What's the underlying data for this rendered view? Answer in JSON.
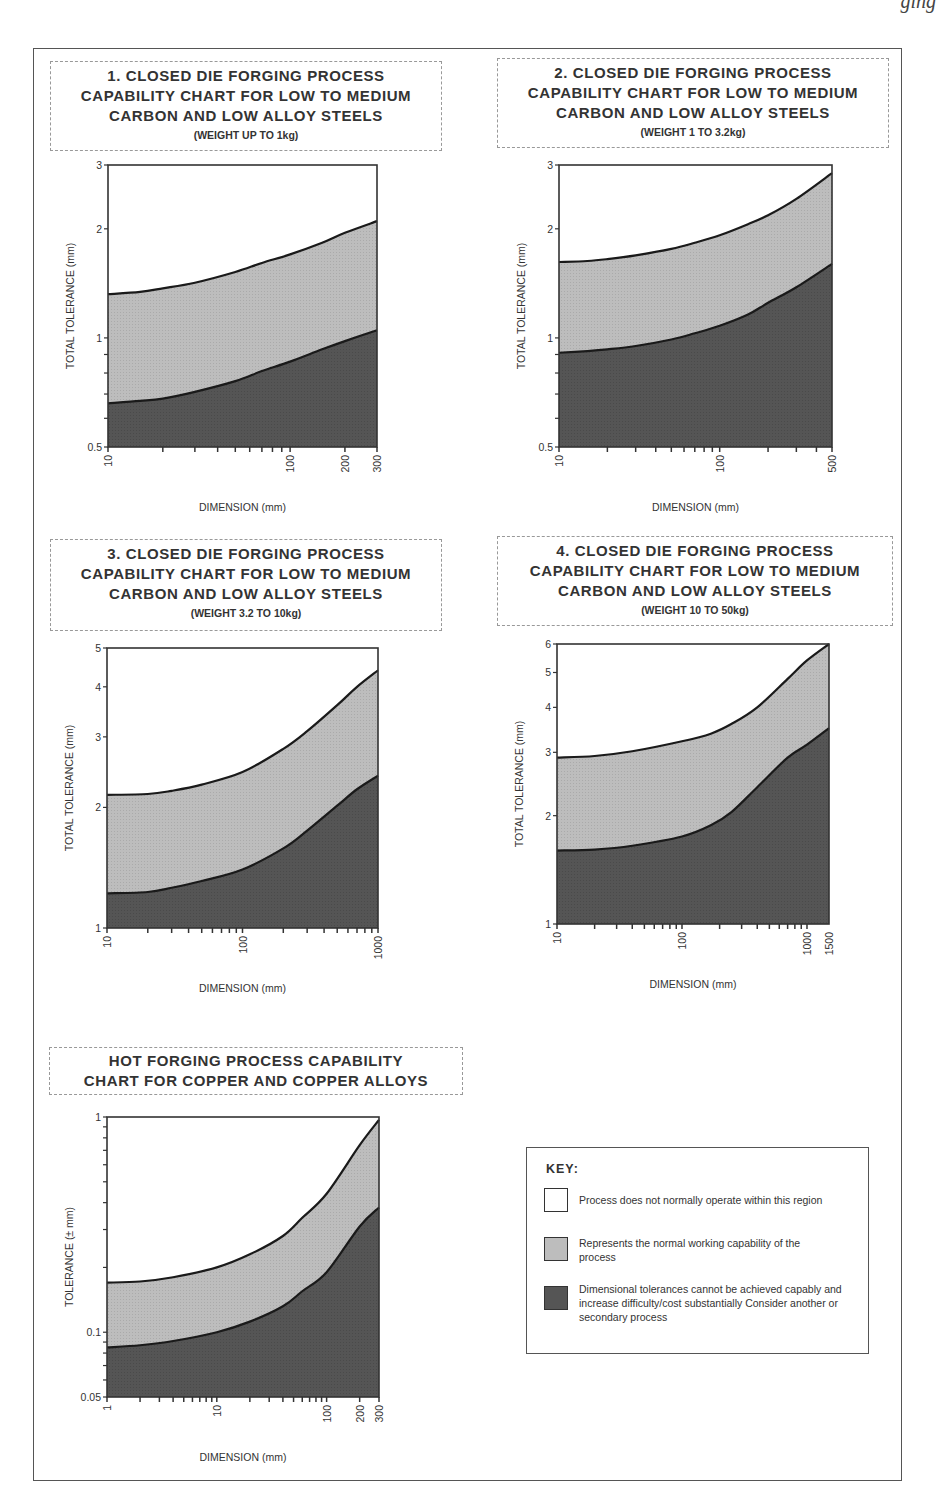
{
  "running_header": {
    "text": "ging"
  },
  "colors": {
    "white_region": "#ffffff",
    "normal_region": "#bdbdbd",
    "difficult_region": "#555555",
    "lines": "#1a1a1a",
    "axis": "#333333"
  },
  "key": {
    "title": "KEY:",
    "items": [
      {
        "swatch": "white",
        "label": "Process does not normally operate within this region"
      },
      {
        "swatch": "light-grey",
        "label": "Represents the normal working capability of the process"
      },
      {
        "swatch": "dark-grey",
        "label": "Dimensional tolerances cannot be achieved capably and increase difficulty/cost substantially Consider another or secondary process"
      }
    ]
  },
  "charts": [
    {
      "title_lines": [
        "1. CLOSED DIE FORGING PROCESS",
        "CAPABILITY CHART FOR LOW TO MEDIUM",
        "CARBON AND LOW ALLOY STEELS"
      ],
      "subtitle": "(WEIGHT UP TO 1kg)"
    },
    {
      "title_lines": [
        "2. CLOSED DIE FORGING PROCESS",
        "CAPABILITY CHART  FOR LOW TO MEDIUM",
        "CARBON AND LOW ALLOY STEELS"
      ],
      "subtitle": "(WEIGHT 1 TO 3.2kg)"
    },
    {
      "title_lines": [
        "3. CLOSED DIE FORGING PROCESS",
        "CAPABILITY CHART FOR LOW TO MEDIUM",
        "CARBON AND LOW ALLOY STEELS"
      ],
      "subtitle": "(WEIGHT 3.2 TO 10kg)"
    },
    {
      "title_lines": [
        "4. CLOSED DIE FORGING PROCESS",
        "CAPABILITY CHART FOR LOW TO MEDIUM",
        "CARBON AND LOW ALLOY STEELS"
      ],
      "subtitle": "(WEIGHT 10 TO 50kg)"
    },
    {
      "title_lines": [
        "HOT FORGING PROCESS CAPABILITY",
        "CHART FOR COPPER AND COPPER ALLOYS"
      ],
      "subtitle": ""
    }
  ],
  "chart_data": [
    {
      "type": "area",
      "title": "1. CLOSED DIE FORGING PROCESS CAPABILITY CHART FOR LOW TO MEDIUM CARBON AND LOW ALLOY STEELS (WEIGHT UP TO 1kg)",
      "xlabel": "DIMENSION (mm)",
      "ylabel": "TOTAL TOLERANCE (mm)",
      "xscale": "log",
      "yscale": "log",
      "xlim": [
        10,
        300
      ],
      "ylim": [
        0.5,
        3
      ],
      "xticks": [
        10,
        100,
        200,
        300
      ],
      "yticks": [
        0.5,
        1,
        2,
        3
      ],
      "x": [
        10,
        15,
        20,
        30,
        50,
        70,
        100,
        150,
        200,
        300
      ],
      "series": [
        {
          "name": "Upper limit (normal capability)",
          "values": [
            1.32,
            1.34,
            1.37,
            1.42,
            1.52,
            1.61,
            1.7,
            1.83,
            1.95,
            2.1
          ]
        },
        {
          "name": "Lower limit (difficult/cost region)",
          "values": [
            0.66,
            0.67,
            0.68,
            0.71,
            0.76,
            0.81,
            0.86,
            0.93,
            0.98,
            1.05
          ]
        }
      ],
      "grid": false,
      "legend": "separate key box"
    },
    {
      "type": "area",
      "title": "2. CLOSED DIE FORGING PROCESS CAPABILITY CHART FOR LOW TO MEDIUM CARBON AND LOW ALLOY STEELS (WEIGHT 1 TO 3.2kg)",
      "xlabel": "DIMENSION (mm)",
      "ylabel": "TOTAL TOLERANCE (mm)",
      "xscale": "log",
      "yscale": "log",
      "xlim": [
        10,
        500
      ],
      "ylim": [
        0.5,
        3
      ],
      "xticks": [
        10,
        100,
        500
      ],
      "yticks": [
        0.5,
        1,
        2,
        3
      ],
      "x": [
        10,
        15,
        20,
        30,
        50,
        70,
        100,
        150,
        200,
        300,
        500
      ],
      "series": [
        {
          "name": "Upper limit (normal capability)",
          "values": [
            1.62,
            1.63,
            1.65,
            1.69,
            1.76,
            1.83,
            1.92,
            2.06,
            2.18,
            2.42,
            2.85
          ]
        },
        {
          "name": "Lower limit (difficult/cost region)",
          "values": [
            0.91,
            0.92,
            0.93,
            0.95,
            0.99,
            1.03,
            1.08,
            1.16,
            1.25,
            1.38,
            1.6
          ]
        }
      ],
      "grid": false,
      "legend": "separate key box"
    },
    {
      "type": "area",
      "title": "3. CLOSED DIE FORGING PROCESS CAPABILITY CHART FOR LOW TO MEDIUM CARBON AND LOW ALLOY STEELS (WEIGHT 3.2 TO 10kg)",
      "xlabel": "DIMENSION (mm)",
      "ylabel": "TOTAL TOLERANCE (mm)",
      "xscale": "log",
      "yscale": "log",
      "xlim": [
        10,
        1000
      ],
      "ylim": [
        1,
        5
      ],
      "xticks": [
        10,
        100,
        1000
      ],
      "yticks": [
        1,
        2,
        3,
        4,
        5
      ],
      "x": [
        10,
        20,
        30,
        50,
        100,
        200,
        300,
        500,
        700,
        1000
      ],
      "series": [
        {
          "name": "Upper limit (normal capability)",
          "values": [
            2.15,
            2.16,
            2.2,
            2.28,
            2.45,
            2.8,
            3.1,
            3.6,
            4.0,
            4.4
          ]
        },
        {
          "name": "Lower limit (difficult/cost region)",
          "values": [
            1.22,
            1.23,
            1.26,
            1.31,
            1.4,
            1.58,
            1.75,
            2.02,
            2.22,
            2.4
          ]
        }
      ],
      "grid": false,
      "legend": "separate key box"
    },
    {
      "type": "area",
      "title": "4. CLOSED DIE FORGING PROCESS CAPABILITY CHART FOR LOW TO MEDIUM CARBON AND LOW ALLOY STEELS (WEIGHT 10 TO 50kg)",
      "xlabel": "DIMENSION (mm)",
      "ylabel": "TOTAL TOLERANCE (mm)",
      "xscale": "log",
      "yscale": "log",
      "xlim": [
        10,
        1500
      ],
      "ylim": [
        1,
        6
      ],
      "xticks": [
        10,
        100,
        1000,
        1500
      ],
      "yticks": [
        1,
        2,
        3,
        4,
        5,
        6
      ],
      "x": [
        10,
        20,
        40,
        100,
        170,
        250,
        400,
        700,
        1000,
        1500
      ],
      "series": [
        {
          "name": "Upper limit (normal capability)",
          "values": [
            2.9,
            2.93,
            3.02,
            3.22,
            3.38,
            3.6,
            4.0,
            4.8,
            5.4,
            6.0
          ]
        },
        {
          "name": "Lower limit (difficult/cost region)",
          "values": [
            1.6,
            1.61,
            1.65,
            1.75,
            1.88,
            2.05,
            2.4,
            2.9,
            3.15,
            3.5
          ]
        }
      ],
      "grid": false,
      "legend": "separate key box"
    },
    {
      "type": "area",
      "title": "HOT FORGING PROCESS CAPABILITY CHART FOR COPPER AND COPPER ALLOYS",
      "xlabel": "DIMENSION (mm)",
      "ylabel": "TOLERANCE (± mm)",
      "xscale": "log",
      "yscale": "log",
      "xlim": [
        1,
        300
      ],
      "ylim": [
        0.05,
        1
      ],
      "xticks": [
        1,
        10,
        100,
        200,
        300
      ],
      "yticks": [
        0.05,
        0.1,
        1
      ],
      "x": [
        1,
        2,
        4,
        10,
        20,
        40,
        60,
        100,
        200,
        300
      ],
      "series": [
        {
          "name": "Upper limit (normal capability)",
          "values": [
            0.17,
            0.172,
            0.18,
            0.2,
            0.23,
            0.28,
            0.34,
            0.44,
            0.74,
            0.97
          ]
        },
        {
          "name": "Lower limit (difficult/cost region)",
          "values": [
            0.085,
            0.087,
            0.091,
            0.1,
            0.112,
            0.132,
            0.155,
            0.19,
            0.31,
            0.38
          ]
        }
      ],
      "grid": false,
      "legend": "separate key box"
    }
  ],
  "layout": {
    "titles": [
      {
        "left": 50,
        "top": 61,
        "width": 392,
        "height": 90
      },
      {
        "left": 497,
        "top": 58,
        "width": 392,
        "height": 90
      },
      {
        "left": 50,
        "top": 539,
        "width": 392,
        "height": 92
      },
      {
        "left": 497,
        "top": 536,
        "width": 396,
        "height": 90
      },
      {
        "left": 49,
        "top": 1047,
        "width": 414,
        "height": 48
      }
    ],
    "plots": [
      {
        "x0": 108,
        "x1": 377,
        "y0": 165,
        "y1": 447
      },
      {
        "x0": 559,
        "x1": 832,
        "y0": 165,
        "y1": 447
      },
      {
        "x0": 107,
        "x1": 378,
        "y0": 648,
        "y1": 928
      },
      {
        "x0": 557,
        "x1": 829,
        "y0": 644,
        "y1": 924
      },
      {
        "x0": 107,
        "x1": 379,
        "y0": 1117,
        "y1": 1397
      }
    ]
  }
}
